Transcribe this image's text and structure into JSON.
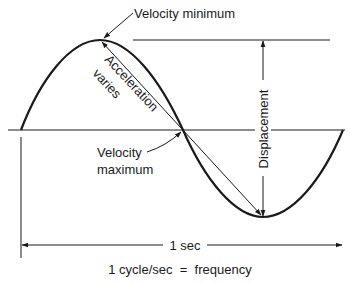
{
  "diagram": {
    "labels": {
      "velocity_minimum": "Velocity minimum",
      "acceleration_line1": "Acceleration",
      "acceleration_line2": "varies",
      "velocity_maximum_line1": "Velocity",
      "velocity_maximum_line2": "maximum",
      "displacement": "Displacement",
      "period": "1 sec",
      "frequency": "1 cycle/sec  =  frequency"
    },
    "geometry": {
      "axis_y": 130,
      "wave_start_x": 21,
      "wave_peak": [
        100,
        40
      ],
      "wave_zero_cross": [
        183,
        130
      ],
      "wave_trough": [
        263,
        217
      ],
      "wave_end_x": 343
    },
    "colors": {
      "stroke": "#1a1a1a",
      "background": "#ffffff"
    }
  }
}
